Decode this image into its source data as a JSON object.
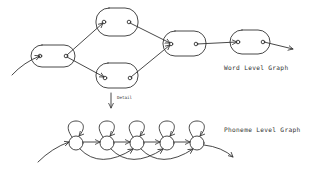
{
  "figure": {
    "word_graph": {
      "label": "Word Level Graph",
      "nodes": [
        {
          "id": "w1",
          "x": 31,
          "y": 45,
          "w": 44,
          "h": 22,
          "in": [
            40,
            56
          ],
          "out": [
            66,
            56
          ]
        },
        {
          "id": "w2",
          "x": 96,
          "y": 8,
          "w": 42,
          "h": 28,
          "in": [
            104,
            22
          ],
          "out": [
            129,
            22
          ]
        },
        {
          "id": "w3",
          "x": 96,
          "y": 63,
          "w": 42,
          "h": 25,
          "in": [
            105,
            78
          ],
          "out": [
            130,
            78
          ]
        },
        {
          "id": "w4",
          "x": 163,
          "y": 31,
          "w": 43,
          "h": 25,
          "in": [
            171,
            44
          ],
          "out": [
            196,
            44
          ]
        },
        {
          "id": "w5",
          "x": 230,
          "y": 30,
          "w": 40,
          "h": 24,
          "in": [
            238,
            42
          ],
          "out": [
            263,
            42
          ]
        }
      ],
      "edges": [
        {
          "from": "w1",
          "to": "w2"
        },
        {
          "from": "w1",
          "to": "w3"
        },
        {
          "from": "w2",
          "to": "w4"
        },
        {
          "from": "w3",
          "to": "w4"
        },
        {
          "from": "w4",
          "to": "w5"
        }
      ]
    },
    "detail_arrow": {
      "label": "Detail"
    },
    "phoneme_graph": {
      "label": "Phoneme Level Graph",
      "nodes": [
        {
          "id": "p1",
          "cx": 76,
          "cy": 143
        },
        {
          "id": "p2",
          "cx": 107,
          "cy": 143
        },
        {
          "id": "p3",
          "cx": 137,
          "cy": 143
        },
        {
          "id": "p4",
          "cx": 167,
          "cy": 143
        },
        {
          "id": "p5",
          "cx": 197,
          "cy": 143
        }
      ],
      "radius": 7,
      "self_loops": true,
      "skip_edges": [
        [
          "p1",
          "p3"
        ],
        [
          "p2",
          "p4"
        ],
        [
          "p3",
          "p5"
        ]
      ]
    }
  }
}
